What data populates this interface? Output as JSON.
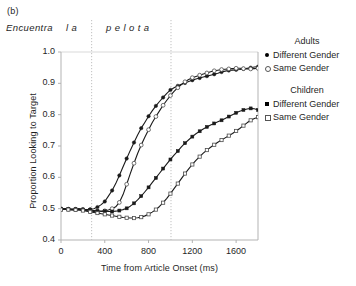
{
  "figure": {
    "panel_label": "(b)",
    "sentence": {
      "words": [
        "Encuentra",
        "l a",
        "p e l o t a"
      ],
      "divider_positions_ms": [
        280,
        1005
      ]
    }
  },
  "legend": {
    "groups": [
      {
        "title": "Adults",
        "entries": [
          {
            "label": "Different Gender",
            "marker": "filled-circle"
          },
          {
            "label": "Same Gender",
            "marker": "open-circle"
          }
        ]
      },
      {
        "title": "Children",
        "entries": [
          {
            "label": "Different Gender",
            "marker": "filled-square"
          },
          {
            "label": "Same Gender",
            "marker": "open-square"
          }
        ]
      }
    ]
  },
  "chart_data": {
    "type": "line",
    "title": "",
    "xlabel": "Time from Article Onset (ms)",
    "ylabel": "Proportion Looking to Target",
    "xlim": [
      0,
      1800
    ],
    "ylim": [
      0.4,
      1.0
    ],
    "xticks": [
      0,
      400,
      800,
      1200,
      1600
    ],
    "xtick_labels": [
      "0",
      "400",
      "800",
      "1200",
      "1600"
    ],
    "yticks": [
      0.4,
      0.5,
      0.6,
      0.7,
      0.8,
      0.9,
      1.0
    ],
    "ytick_labels": [
      "0.4",
      "0.5",
      "0.6",
      "0.7",
      "0.8",
      "0.9",
      "1.0"
    ],
    "grid": false,
    "gridline_top_at": 1.0,
    "legend_position": "right",
    "annotations": [
      {
        "type": "vline",
        "x": 280,
        "style": "dotted",
        "label": "article onset boundary"
      },
      {
        "type": "vline",
        "x": 1005,
        "style": "dotted",
        "label": "noun onset boundary"
      }
    ],
    "x": [
      0,
      33,
      67,
      100,
      133,
      167,
      200,
      233,
      267,
      300,
      333,
      367,
      400,
      433,
      467,
      500,
      533,
      567,
      600,
      633,
      667,
      700,
      733,
      767,
      800,
      833,
      867,
      900,
      933,
      967,
      1000,
      1033,
      1067,
      1100,
      1133,
      1167,
      1200,
      1233,
      1267,
      1300,
      1333,
      1367,
      1400,
      1433,
      1467,
      1500,
      1533,
      1567,
      1600,
      1633,
      1667,
      1700,
      1733,
      1767,
      1800
    ],
    "series": [
      {
        "name": "Adults Different Gender",
        "group": "Adults",
        "marker": "filled-circle",
        "values": [
          0.5,
          0.5,
          0.499,
          0.498,
          0.499,
          0.5,
          0.498,
          0.497,
          0.498,
          0.5,
          0.505,
          0.513,
          0.523,
          0.54,
          0.558,
          0.58,
          0.606,
          0.634,
          0.66,
          0.686,
          0.711,
          0.735,
          0.757,
          0.776,
          0.795,
          0.812,
          0.828,
          0.842,
          0.855,
          0.868,
          0.879,
          0.886,
          0.892,
          0.897,
          0.901,
          0.906,
          0.91,
          0.914,
          0.917,
          0.92,
          0.923,
          0.926,
          0.929,
          0.932,
          0.936,
          0.939,
          0.941,
          0.942,
          0.943,
          0.944,
          0.946,
          0.948,
          0.95,
          0.952,
          0.953
        ]
      },
      {
        "name": "Adults Same Gender",
        "group": "Adults",
        "marker": "open-circle",
        "values": [
          0.498,
          0.499,
          0.498,
          0.497,
          0.497,
          0.498,
          0.497,
          0.494,
          0.492,
          0.491,
          0.49,
          0.491,
          0.493,
          0.496,
          0.5,
          0.506,
          0.52,
          0.545,
          0.578,
          0.612,
          0.645,
          0.676,
          0.703,
          0.729,
          0.752,
          0.774,
          0.794,
          0.812,
          0.83,
          0.846,
          0.861,
          0.874,
          0.886,
          0.896,
          0.905,
          0.912,
          0.918,
          0.922,
          0.926,
          0.93,
          0.933,
          0.937,
          0.94,
          0.942,
          0.944,
          0.945,
          0.946,
          0.947,
          0.948,
          0.948,
          0.947,
          0.946,
          0.946,
          0.947,
          0.948
        ]
      },
      {
        "name": "Children Different Gender",
        "group": "Children",
        "marker": "filled-square",
        "values": [
          0.5,
          0.5,
          0.499,
          0.499,
          0.498,
          0.499,
          0.497,
          0.496,
          0.495,
          0.494,
          0.493,
          0.492,
          0.492,
          0.491,
          0.491,
          0.492,
          0.494,
          0.497,
          0.501,
          0.508,
          0.517,
          0.528,
          0.54,
          0.554,
          0.568,
          0.583,
          0.598,
          0.613,
          0.628,
          0.643,
          0.657,
          0.671,
          0.684,
          0.697,
          0.709,
          0.72,
          0.73,
          0.739,
          0.747,
          0.754,
          0.761,
          0.767,
          0.772,
          0.777,
          0.782,
          0.788,
          0.794,
          0.8,
          0.806,
          0.811,
          0.815,
          0.818,
          0.82,
          0.819,
          0.815
        ]
      },
      {
        "name": "Children Same Gender",
        "group": "Children",
        "marker": "open-square",
        "values": [
          0.497,
          0.498,
          0.497,
          0.496,
          0.496,
          0.495,
          0.494,
          0.492,
          0.49,
          0.488,
          0.486,
          0.484,
          0.482,
          0.48,
          0.478,
          0.476,
          0.474,
          0.472,
          0.471,
          0.47,
          0.47,
          0.471,
          0.473,
          0.477,
          0.482,
          0.489,
          0.497,
          0.507,
          0.519,
          0.533,
          0.548,
          0.564,
          0.58,
          0.596,
          0.612,
          0.627,
          0.641,
          0.654,
          0.666,
          0.677,
          0.687,
          0.696,
          0.704,
          0.712,
          0.719,
          0.726,
          0.733,
          0.74,
          0.748,
          0.756,
          0.765,
          0.774,
          0.782,
          0.788,
          0.792
        ]
      }
    ]
  },
  "colors": {
    "line": "#1a1a1a",
    "open_marker_stroke": "#4d4d4d",
    "open_marker_fill": "#ffffff",
    "axis": "#b3b3b3",
    "gridline": "#d9d9d9",
    "dotted_divider": "#c0c0c0",
    "text": "#1f1f1f"
  }
}
